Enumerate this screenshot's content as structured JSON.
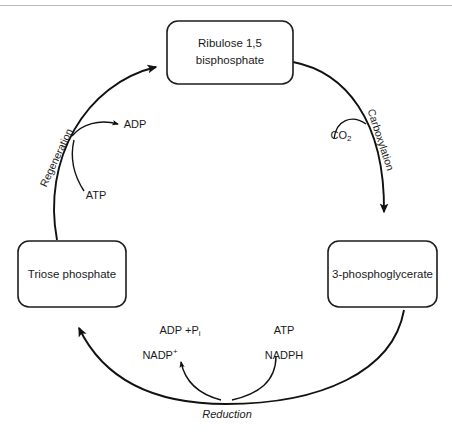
{
  "diagram": {
    "background_color": "#ffffff",
    "stroke_color": "#111111",
    "top_rule_color": "#b9b9b9",
    "nodes": [
      {
        "id": "ribulose",
        "line1": "Ribulose 1,5",
        "line2": "bisphosphate"
      },
      {
        "id": "phosphoglycerate",
        "line1": "3-phosphoglycerate",
        "line2": ""
      },
      {
        "id": "triose",
        "line1": "Triose phosphate",
        "line2": ""
      }
    ],
    "stage_labels": [
      {
        "id": "carboxylation",
        "text": "Carboxylation"
      },
      {
        "id": "reduction",
        "text": "Reduction"
      },
      {
        "id": "regeneration",
        "text": "Regeneration"
      }
    ],
    "molecules": [
      {
        "id": "co2",
        "base": "CO",
        "sub": "2",
        "sup": ""
      },
      {
        "id": "atp-reduction",
        "base": "ATP",
        "sub": "",
        "sup": ""
      },
      {
        "id": "nadph",
        "base": "NADPH",
        "sub": "",
        "sup": ""
      },
      {
        "id": "adp-pi",
        "base": "ADP +P",
        "sub": "i",
        "sup": ""
      },
      {
        "id": "nadp-plus",
        "base": "NADP",
        "sub": "",
        "sup": "+"
      },
      {
        "id": "atp-regeneration",
        "base": "ATP",
        "sub": "",
        "sup": ""
      },
      {
        "id": "adp-regeneration",
        "base": "ADP",
        "sub": "",
        "sup": ""
      }
    ]
  }
}
